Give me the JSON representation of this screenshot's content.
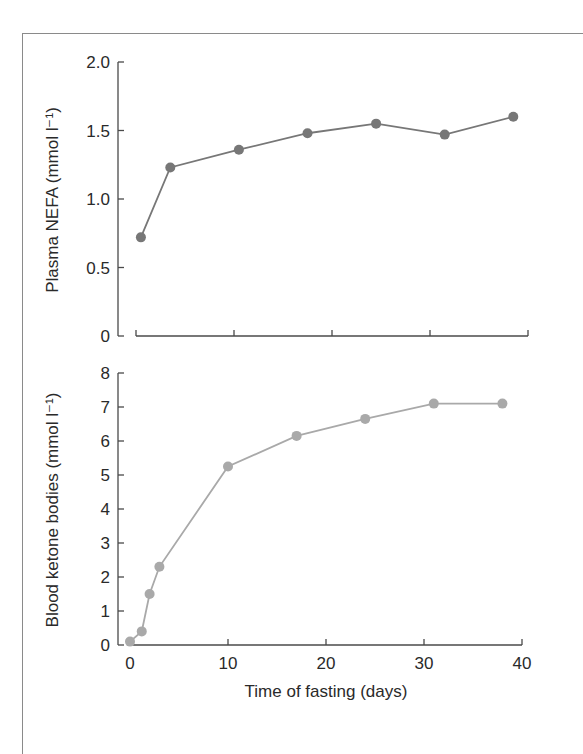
{
  "chart_data": [
    {
      "type": "line",
      "panel": "top",
      "title": "",
      "xlabel": "",
      "ylabel": "Plasma NEFA (mmol l⁻¹)",
      "ylim": [
        0,
        2.0
      ],
      "xlim": [
        0,
        40
      ],
      "yticks": [
        0,
        0.5,
        1.0,
        1.5,
        2.0
      ],
      "ytick_labels": [
        "0",
        "0.5",
        "1.0",
        "1.5",
        "2.0"
      ],
      "xticks": [
        0,
        10,
        20,
        30,
        40
      ],
      "xtick_labels": [],
      "grid": false,
      "legend": null,
      "series": [
        {
          "name": "Plasma NEFA",
          "color": "#777777",
          "x": [
            0.5,
            3.5,
            10.5,
            17.5,
            24.5,
            31.5,
            38.5
          ],
          "values": [
            0.72,
            1.23,
            1.36,
            1.48,
            1.55,
            1.47,
            1.6
          ]
        }
      ]
    },
    {
      "type": "line",
      "panel": "bottom",
      "title": "",
      "xlabel": "Time of fasting (days)",
      "ylabel": "Blood ketone bodies (mmol l⁻¹)",
      "ylim": [
        0,
        8
      ],
      "xlim": [
        0,
        40
      ],
      "yticks": [
        0,
        1,
        2,
        3,
        4,
        5,
        6,
        7,
        8
      ],
      "ytick_labels": [
        "0",
        "1",
        "2",
        "3",
        "4",
        "5",
        "6",
        "7",
        "8"
      ],
      "xticks": [
        0,
        10,
        20,
        30,
        40
      ],
      "xtick_labels": [
        "0",
        "10",
        "20",
        "30",
        "40"
      ],
      "grid": false,
      "legend": null,
      "series": [
        {
          "name": "Blood ketone bodies",
          "color": "#a9a9a9",
          "x": [
            0,
            1.2,
            2,
            3,
            10,
            17,
            24,
            31,
            38
          ],
          "values": [
            0.1,
            0.4,
            1.5,
            2.3,
            5.25,
            6.15,
            6.65,
            7.1,
            7.1
          ]
        }
      ]
    }
  ],
  "layout": {
    "panels": [
      {
        "y_axis_x": 118,
        "y_top": 62,
        "y_bottom": 336,
        "x_axis_y": 336,
        "x_left": 136,
        "x_right": 528,
        "label_x": 58,
        "label_center_y": 200
      },
      {
        "y_axis_x": 118,
        "y_top": 373,
        "y_bottom": 645,
        "x_axis_y": 645,
        "x_left": 130,
        "x_right": 522,
        "label_x": 58,
        "label_center_y": 510
      }
    ],
    "xlabel_y": 697
  }
}
